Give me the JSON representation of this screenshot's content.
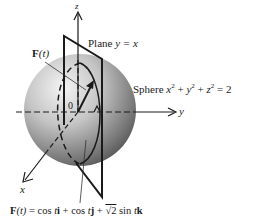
{
  "diagram": {
    "axes": {
      "z": "z",
      "y": "y",
      "x": "x",
      "origin": "0"
    },
    "labels": {
      "vector_label": "F(t)",
      "vector_bold": "F",
      "vector_arg": "(t)",
      "plane_prefix": "Plane ",
      "plane_eq": "y = x",
      "sphere_prefix": "Sphere ",
      "sphere_eq_x": "x",
      "sphere_eq_plus1": " + ",
      "sphere_eq_y": "y",
      "sphere_eq_plus2": " + ",
      "sphere_eq_z": "z",
      "sphere_eq_rhs": " = 2",
      "exponent": "2"
    },
    "formula": {
      "lhs_bold": "F",
      "lhs_arg": "(t)",
      "eq": " = cos ",
      "t1": "t",
      "i": "i",
      "plus1": " + cos ",
      "t2": "t",
      "j": "j",
      "plus2": " + ",
      "sqrt2": "√2",
      "sin": " sin ",
      "t3": "t",
      "k": "k"
    },
    "colors": {
      "sphere_light": "#f2f2f2",
      "sphere_mid": "#b5b5b5",
      "sphere_dark": "#5a5a5a",
      "line": "#1a1a1a"
    }
  }
}
